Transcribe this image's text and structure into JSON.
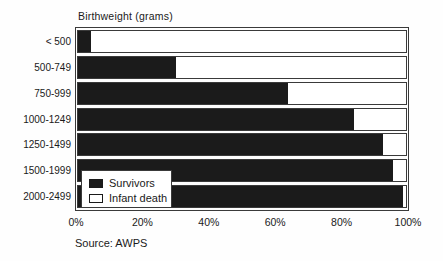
{
  "figure": {
    "background": "#fefefe",
    "frame_border_color": "#3a3a3a",
    "text_color": "#1a1a1a"
  },
  "chart_data": {
    "type": "bar",
    "orientation": "horizontal",
    "stacked": true,
    "title": "Birthweight (grams)",
    "source": "Source: AWPS",
    "categories": [
      "< 500",
      "500-749",
      "750-999",
      "1000-1249",
      "1250-1499",
      "1500-1999",
      "2000-2499"
    ],
    "series": [
      {
        "name": "Survivors",
        "values": [
          4,
          30,
          64,
          84,
          93,
          96,
          99
        ],
        "color": "#1b1b1b"
      },
      {
        "name": "Infant death",
        "values": [
          96,
          70,
          36,
          16,
          7,
          4,
          1
        ],
        "color": "#ffffff"
      }
    ],
    "values_unit": "percent of birthweight group",
    "xlim": [
      0,
      100
    ],
    "x_ticks": [
      "0%",
      "20%",
      "40%",
      "60%",
      "80%",
      "100%"
    ],
    "grid": false,
    "legend_position": "inside-bottom-left"
  }
}
